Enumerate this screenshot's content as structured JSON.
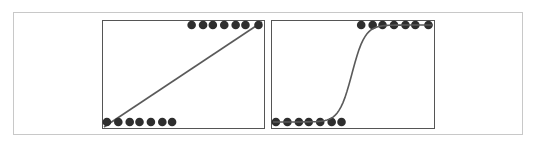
{
  "chart_data": [
    {
      "type": "scatter",
      "title": "",
      "description": "Linear model fit to binary data",
      "xlabel": "",
      "ylabel": "",
      "points_low_y": [
        0.03,
        0.1,
        0.17,
        0.23,
        0.3,
        0.37,
        0.43
      ],
      "points_high_y": [
        0.55,
        0.62,
        0.68,
        0.75,
        0.82,
        0.88,
        0.96
      ],
      "fit": "linear",
      "grid": false
    },
    {
      "type": "scatter",
      "title": "",
      "description": "Logistic (sigmoid) model fit to binary data",
      "xlabel": "",
      "ylabel": "",
      "points_low_y": [
        0.03,
        0.1,
        0.17,
        0.23,
        0.3,
        0.37,
        0.43
      ],
      "points_high_y": [
        0.55,
        0.62,
        0.68,
        0.75,
        0.82,
        0.88,
        0.96
      ],
      "fit": "sigmoid",
      "grid": false
    }
  ],
  "style": {
    "dot_color": "#2e2e2e",
    "line_color": "#5a5a5a",
    "panel_border": "#555555",
    "frame_border": "#c8c8c8"
  }
}
